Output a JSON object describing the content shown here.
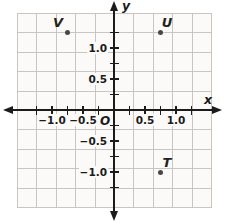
{
  "chart_data": {
    "type": "scatter",
    "points": [
      {
        "label": "V",
        "x": -0.75,
        "y": 1.25,
        "label_side": "upper-left"
      },
      {
        "label": "U",
        "x": 0.75,
        "y": 1.25,
        "label_side": "upper-right"
      },
      {
        "label": "T",
        "x": 0.75,
        "y": -1.0,
        "label_side": "upper-right"
      }
    ],
    "axes": {
      "x_label": "x",
      "y_label": "y",
      "origin_label": "O",
      "xlim": [
        -1.4,
        1.4
      ],
      "ylim": [
        -1.4,
        1.4
      ],
      "tick_step": 0.25,
      "x_tick_labels": [
        {
          "value": -1.0,
          "text": "−1.0"
        },
        {
          "value": -0.5,
          "text": "−0.5"
        },
        {
          "value": 0.5,
          "text": "0.5"
        },
        {
          "value": 1.0,
          "text": "1.0"
        }
      ],
      "y_tick_labels": [
        {
          "value": 1.0,
          "text": "1.0"
        },
        {
          "value": 0.5,
          "text": "0.5"
        },
        {
          "value": -0.5,
          "text": "−0.5"
        },
        {
          "value": -1.0,
          "text": "−1.0"
        }
      ]
    },
    "grid": {
      "visible": true,
      "cells": 10
    },
    "legend": null,
    "title": "",
    "colors": {
      "axis": "#1b1b1b",
      "grid_line": "#c9c6c1",
      "plot_background": "#fbfaf8",
      "page_background": "#ffffff",
      "point": "#484848",
      "text": "#1b1b1b"
    }
  }
}
